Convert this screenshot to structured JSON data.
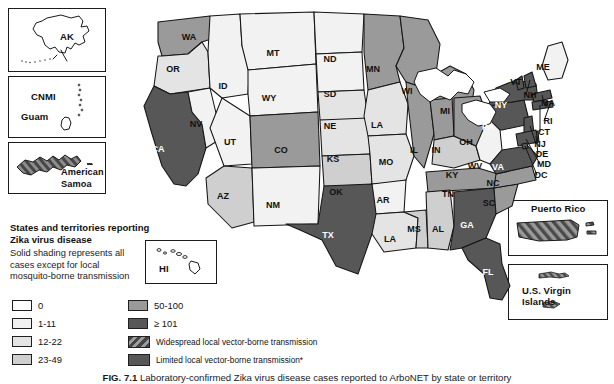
{
  "figure": {
    "number": "FIG. 7.1",
    "caption": "Laboratory-confirmed Zika virus disease cases reported to ArboNET by state or territory"
  },
  "legend": {
    "title_line1": "States and territories reporting",
    "title_line2": "Zika virus disease",
    "note_line1": "Solid shading represents all",
    "note_line2": "cases except for local",
    "note_line3": "mosquito-borne transmission",
    "count_items": [
      {
        "label": "0",
        "color": "#ffffff"
      },
      {
        "label": "1-11",
        "color": "#f2f2f2"
      },
      {
        "label": "12-22",
        "color": "#e4e4e4"
      },
      {
        "label": "23-49",
        "color": "#cfcfcf"
      },
      {
        "label": "50-100",
        "color": "#9a9a9a"
      },
      {
        "label": "≥ 101",
        "color": "#575757"
      }
    ],
    "pattern_items": [
      {
        "label": "Widespread local vector-borne transmission",
        "pattern": "hatched"
      },
      {
        "label": "Limited local vector-borne transmission*",
        "pattern": "solid-dark"
      }
    ]
  },
  "insets": [
    {
      "name": "alaska",
      "labels": [
        "AK"
      ]
    },
    {
      "name": "cnmi-guam",
      "labels": [
        "CNMI",
        "Guam"
      ]
    },
    {
      "name": "american-samoa",
      "labels": [
        "American",
        "Samoa"
      ]
    },
    {
      "name": "hawaii",
      "labels": [
        "HI"
      ]
    },
    {
      "name": "puerto-rico",
      "labels": [
        "Puerto Rico"
      ]
    },
    {
      "name": "us-virgin-islands",
      "labels": [
        "U.S. Virgin Islands"
      ]
    }
  ],
  "map": {
    "states": [
      {
        "id": "WA",
        "label": "WA",
        "fill": "#9a9a9a",
        "lx": 71,
        "ly": 30,
        "light": false
      },
      {
        "id": "OR",
        "label": "OR",
        "fill": "#e4e4e4",
        "lx": 55,
        "ly": 62,
        "light": false
      },
      {
        "id": "CA",
        "label": "CA",
        "fill": "#575757",
        "lx": 40,
        "ly": 142,
        "light": true
      },
      {
        "id": "NV",
        "label": "NV",
        "fill": "#f2f2f2",
        "lx": 78,
        "ly": 117,
        "light": false
      },
      {
        "id": "ID",
        "label": "ID",
        "fill": "#f2f2f2",
        "lx": 105,
        "ly": 79,
        "light": false
      },
      {
        "id": "MT",
        "label": "MT",
        "fill": "#f2f2f2",
        "lx": 155,
        "ly": 46,
        "light": false
      },
      {
        "id": "WY",
        "label": "WY",
        "fill": "#f2f2f2",
        "lx": 151,
        "ly": 91,
        "light": false
      },
      {
        "id": "UT",
        "label": "UT",
        "fill": "#f2f2f2",
        "lx": 112,
        "ly": 135,
        "light": false
      },
      {
        "id": "CO",
        "label": "CO",
        "fill": "#9a9a9a",
        "lx": 163,
        "ly": 143,
        "light": false
      },
      {
        "id": "AZ",
        "label": "AZ",
        "fill": "#cfcfcf",
        "lx": 105,
        "ly": 189,
        "light": false
      },
      {
        "id": "NM",
        "label": "NM",
        "fill": "#f2f2f2",
        "lx": 155,
        "ly": 198,
        "light": false
      },
      {
        "id": "ND",
        "label": "ND",
        "fill": "#f2f2f2",
        "lx": 212,
        "ly": 52,
        "light": false
      },
      {
        "id": "SD",
        "label": "SD",
        "fill": "#f2f2f2",
        "lx": 212,
        "ly": 87,
        "light": false
      },
      {
        "id": "NE",
        "label": "NE",
        "fill": "#e4e4e4",
        "lx": 212,
        "ly": 119,
        "light": false
      },
      {
        "id": "KS",
        "label": "KS",
        "fill": "#e4e4e4",
        "lx": 215,
        "ly": 152,
        "light": false
      },
      {
        "id": "OK",
        "label": "OK",
        "fill": "#cfcfcf",
        "lx": 218,
        "ly": 185,
        "light": false
      },
      {
        "id": "TX",
        "label": "TX",
        "fill": "#575757",
        "lx": 210,
        "ly": 228,
        "light": true
      },
      {
        "id": "MN",
        "label": "MN",
        "fill": "#9a9a9a",
        "lx": 255,
        "ly": 62,
        "light": false
      },
      {
        "id": "IA",
        "label": "LA",
        "fill": "#e4e4e4",
        "lx": 259,
        "ly": 118,
        "light": false
      },
      {
        "id": "MO",
        "label": "MO",
        "fill": "#e4e4e4",
        "lx": 268,
        "ly": 155,
        "light": false
      },
      {
        "id": "AR",
        "label": "AR",
        "fill": "#f2f2f2",
        "lx": 265,
        "ly": 193,
        "light": false
      },
      {
        "id": "LA",
        "label": "LA",
        "fill": "#e4e4e4",
        "lx": 272,
        "ly": 232,
        "light": false
      },
      {
        "id": "WI",
        "label": "WI",
        "fill": "#9a9a9a",
        "lx": 289,
        "ly": 84,
        "light": false
      },
      {
        "id": "IL",
        "label": "IL",
        "fill": "#9a9a9a",
        "lx": 296,
        "ly": 143,
        "light": false
      },
      {
        "id": "MS",
        "label": "MS",
        "fill": "#cfcfcf",
        "lx": 296,
        "ly": 222,
        "light": false
      },
      {
        "id": "MI",
        "label": "MI",
        "fill": "#9a9a9a",
        "lx": 327,
        "ly": 104,
        "light": false
      },
      {
        "id": "IN",
        "label": "IN",
        "fill": "#9a9a9a",
        "lx": 318,
        "ly": 143,
        "light": false
      },
      {
        "id": "KY",
        "label": "KY",
        "fill": "#cfcfcf",
        "lx": 334,
        "ly": 168,
        "light": false
      },
      {
        "id": "TN",
        "label": "TN",
        "fill": "#9a9a9a",
        "lx": 330,
        "ly": 187,
        "light": false
      },
      {
        "id": "AL",
        "label": "AL",
        "fill": "#cfcfcf",
        "lx": 320,
        "ly": 222,
        "light": false
      },
      {
        "id": "OH",
        "label": "OH",
        "fill": "#9a9a9a",
        "lx": 348,
        "ly": 135,
        "light": false
      },
      {
        "id": "GA",
        "label": "GA",
        "fill": "#575757",
        "lx": 349,
        "ly": 218,
        "light": true
      },
      {
        "id": "FL",
        "label": "FL",
        "fill": "#575757",
        "lx": 370,
        "ly": 265,
        "light": true
      },
      {
        "id": "SC",
        "label": "SC",
        "fill": "#9a9a9a",
        "lx": 371,
        "ly": 196,
        "light": false
      },
      {
        "id": "NC",
        "label": "NC",
        "fill": "#9a9a9a",
        "lx": 375,
        "ly": 176,
        "light": false
      },
      {
        "id": "WV",
        "label": "WV",
        "fill": "#f2f2f2",
        "lx": 357,
        "ly": 159,
        "light": false
      },
      {
        "id": "VA",
        "label": "VA",
        "fill": "#575757",
        "lx": 380,
        "ly": 160,
        "light": true
      },
      {
        "id": "PA",
        "label": "PA",
        "fill": "#575757",
        "lx": 370,
        "ly": 120,
        "light": true
      },
      {
        "id": "NY",
        "label": "NY",
        "fill": "#575757",
        "lx": 383,
        "ly": 98,
        "light": true
      },
      {
        "id": "ME",
        "label": "ME",
        "fill": "#f2f2f2",
        "lx": 425,
        "ly": 60,
        "light": false
      }
    ],
    "callouts": [
      {
        "id": "VT",
        "label": "VT",
        "tx": 398,
        "ty": 75
      },
      {
        "id": "NH",
        "label": "NH",
        "tx": 412,
        "ty": 88
      },
      {
        "id": "MA",
        "label": "MA",
        "tx": 430,
        "ty": 96
      },
      {
        "id": "RI",
        "label": "RI",
        "tx": 430,
        "ty": 114
      },
      {
        "id": "CT",
        "label": "CT",
        "tx": 426,
        "ty": 125
      },
      {
        "id": "NJ",
        "label": "NJ",
        "tx": 422,
        "ty": 137
      },
      {
        "id": "DE",
        "label": "DE",
        "tx": 424,
        "ty": 147
      },
      {
        "id": "MD",
        "label": "MD",
        "tx": 426,
        "ty": 157
      },
      {
        "id": "DC",
        "label": "DC",
        "tx": 423,
        "ty": 168
      }
    ]
  }
}
